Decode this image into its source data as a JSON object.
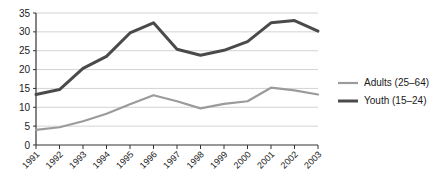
{
  "chart_data": {
    "type": "line",
    "title": "",
    "subtitle": "",
    "xlabel": "",
    "ylabel": "",
    "categories": [
      "1991",
      "1992",
      "1993",
      "1994",
      "1995",
      "1996",
      "1997",
      "1998",
      "1999",
      "2000",
      "2001",
      "2002",
      "2003"
    ],
    "series": [
      {
        "name": "Adults (25–64)",
        "color": "#9b9b9b",
        "values": [
          4.0,
          4.7,
          6.3,
          8.2,
          10.6,
          12.8,
          13.2,
          11.6,
          9.7,
          10.9,
          11.0,
          11.6,
          15.2
        ]
      },
      {
        "name": "Youth (15–24)",
        "color": "#4a4a4a",
        "values": [
          13.4,
          14.7,
          17.8,
          20.5,
          23.5,
          27.0,
          29.7,
          32.4,
          25.4,
          23.8,
          25.1,
          26.2,
          27.4
        ]
      }
    ],
    "series_display": [
      {
        "name": "Adults (25–64)",
        "color": "#9b9b9b",
        "points": [
          {
            "x": "1991",
            "y": 4.0
          },
          {
            "x": "1992",
            "y": 4.7
          },
          {
            "x": "1993",
            "y": 6.3
          },
          {
            "x": "1994",
            "y": 8.3
          },
          {
            "x": "1995",
            "y": 10.8
          },
          {
            "x": "1996",
            "y": 13.2
          },
          {
            "x": "1997",
            "y": 11.6
          },
          {
            "x": "1998",
            "y": 9.7
          },
          {
            "x": "1999",
            "y": 10.9
          },
          {
            "x": "2000",
            "y": 11.6
          },
          {
            "x": "2001",
            "y": 15.2
          },
          {
            "x": "2002",
            "y": 14.5
          },
          {
            "x": "2003",
            "y": 13.4
          }
        ]
      },
      {
        "name": "Youth (15–24)",
        "color": "#4a4a4a",
        "points": [
          {
            "x": "1991",
            "y": 13.4
          },
          {
            "x": "1992",
            "y": 14.7
          },
          {
            "x": "1993",
            "y": 20.3
          },
          {
            "x": "1994",
            "y": 23.5
          },
          {
            "x": "1995",
            "y": 29.7
          },
          {
            "x": "1996",
            "y": 32.4
          },
          {
            "x": "1997",
            "y": 25.4
          },
          {
            "x": "1998",
            "y": 23.8
          },
          {
            "x": "1999",
            "y": 25.1
          },
          {
            "x": "2000",
            "y": 27.4
          },
          {
            "x": "2001",
            "y": 32.4
          },
          {
            "x": "2002",
            "y": 33.0
          },
          {
            "x": "2003",
            "y": 30.2
          }
        ]
      }
    ],
    "yticks": [
      0,
      5,
      10,
      15,
      20,
      25,
      30,
      35
    ],
    "ylim": [
      0,
      35
    ],
    "grid": true,
    "grid_color": "#c8c8c8",
    "axis_color": "#333333",
    "legend_position": "right",
    "xtick_rotation": -45
  },
  "legend": {
    "items": [
      {
        "label": "Adults (25–64)",
        "color": "#9b9b9b",
        "width": 2.2
      },
      {
        "label": "Youth (15–24)",
        "color": "#4a4a4a",
        "width": 3.0
      }
    ]
  }
}
